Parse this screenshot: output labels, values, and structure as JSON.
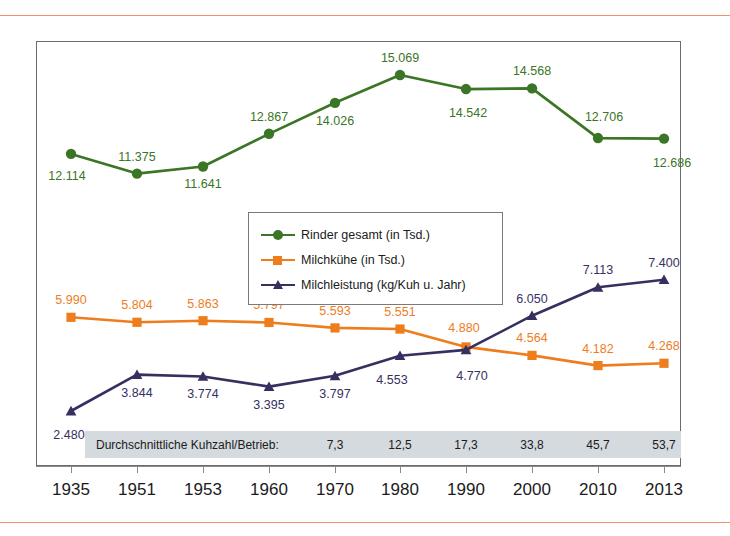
{
  "colors": {
    "green": "#3b7526",
    "orange": "#ee7d1e",
    "purple": "#35305f",
    "rule": "#f09070",
    "kuhbar_bg": "#d5dade",
    "frame": "#6b6b6b"
  },
  "legend": {
    "items": [
      {
        "label": "Rinder gesamt (in Tsd.)",
        "color": "#3b7526",
        "marker": "circle"
      },
      {
        "label": "Milchkühe (in Tsd.)",
        "color": "#ee7d1e",
        "marker": "square"
      },
      {
        "label": "Milchleistung (kg/Kuh u. Jahr)",
        "color": "#35305f",
        "marker": "triangle"
      }
    ]
  },
  "kuhzahl": {
    "label": "Durchschnittliche Kuhzahl/Betrieb:",
    "values": [
      "",
      "",
      "",
      "",
      "7,3",
      "12,5",
      "17,3",
      "33,8",
      "45,7",
      "53,7"
    ]
  },
  "chart_data": {
    "type": "line",
    "title": "",
    "xlabel": "",
    "ylabel": "",
    "grid": false,
    "legend_position": "inside-center-left",
    "categories": [
      "1935",
      "1951",
      "1953",
      "1960",
      "1970",
      "1980",
      "1990",
      "2000",
      "2010",
      "2013"
    ],
    "series": [
      {
        "name": "Rinder gesamt (in Tsd.)",
        "color": "#3b7526",
        "marker": "circle",
        "values": [
          12114,
          11375,
          11641,
          12867,
          14026,
          15069,
          14542,
          14568,
          12706,
          12686
        ],
        "labels": [
          "12.114",
          "11.375",
          "11.641",
          "12.867",
          "14.026",
          "15.069",
          "14.542",
          "14.568",
          "12.706",
          "12.686"
        ],
        "label_positions": [
          "below",
          "above",
          "below",
          "above",
          "below",
          "above",
          "below",
          "above",
          "above",
          "below"
        ]
      },
      {
        "name": "Milchkühe (in Tsd.)",
        "color": "#ee7d1e",
        "marker": "square",
        "values": [
          5990,
          5804,
          5863,
          5797,
          5593,
          5551,
          4880,
          4564,
          4182,
          4268
        ],
        "labels": [
          "5.990",
          "5.804",
          "5.863",
          "5.797",
          "5.593",
          "5.551",
          "4.880",
          "4.564",
          "4.182",
          "4.268"
        ],
        "label_positions": [
          "above",
          "above",
          "above",
          "above",
          "above",
          "above",
          "above",
          "above",
          "above",
          "above"
        ]
      },
      {
        "name": "Milchleistung (kg/Kuh u. Jahr)",
        "color": "#35305f",
        "marker": "triangle",
        "values": [
          2480,
          3844,
          3774,
          3395,
          3797,
          4553,
          4770,
          6050,
          7113,
          7400
        ],
        "labels": [
          "2.480",
          "3.844",
          "3.774",
          "3.395",
          "3.797",
          "4.553",
          "4.770",
          "6.050",
          "7.113",
          "7.400"
        ],
        "label_positions": [
          "below",
          "below",
          "below",
          "below",
          "below",
          "below",
          "below",
          "above",
          "above",
          "above"
        ]
      }
    ],
    "x_tick_labels": [
      "1935",
      "1951",
      "1953",
      "1960",
      "1970",
      "1980",
      "1990",
      "2000",
      "2010",
      "2013"
    ]
  }
}
